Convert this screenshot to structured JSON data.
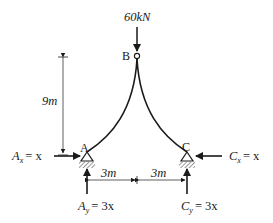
{
  "diagram": {
    "type": "three-hinged arch free-body diagram",
    "colors": {
      "ink": "#1a1a1a",
      "background": "#ffffff",
      "hatch": "#555555"
    },
    "load": {
      "value": "60",
      "unit": "kN",
      "label": "60kN",
      "point": "B",
      "direction": "down"
    },
    "nodes": {
      "A": {
        "label": "A",
        "support": "pin"
      },
      "B": {
        "label": "B",
        "type": "hinge"
      },
      "C": {
        "label": "C",
        "support": "pin"
      }
    },
    "dimensions": {
      "height": {
        "value": "9",
        "unit": "m",
        "label": "9m"
      },
      "span_left": {
        "value": "3",
        "unit": "m",
        "label": "3m"
      },
      "span_right": {
        "value": "3",
        "unit": "m",
        "label": "3m"
      }
    },
    "reactions": {
      "Ax": {
        "symbol": "A",
        "sub": "x",
        "rhs": "= x",
        "direction": "right"
      },
      "Ay": {
        "symbol": "A",
        "sub": "y",
        "rhs": "= 3x",
        "direction": "up"
      },
      "Cx": {
        "symbol": "C",
        "sub": "x",
        "rhs": "= x",
        "direction": "left"
      },
      "Cy": {
        "symbol": "C",
        "sub": "y",
        "rhs": "= 3x",
        "direction": "up"
      }
    }
  }
}
